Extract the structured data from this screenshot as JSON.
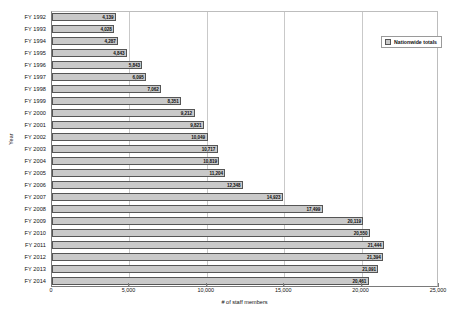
{
  "chart_data": {
    "type": "bar",
    "orientation": "horizontal",
    "title": "",
    "xlabel": "# of staff members",
    "ylabel": "Year",
    "xlim": [
      0,
      25000
    ],
    "xticks": [
      "0",
      "5,000",
      "10,000",
      "15,000",
      "20,000",
      "25,000"
    ],
    "xtick_values": [
      0,
      5000,
      10000,
      15000,
      20000,
      25000
    ],
    "grid": true,
    "legend": {
      "position": "top-right",
      "entries": [
        {
          "label": "Nationwide totals",
          "color": "#c9c9c9"
        }
      ]
    },
    "categories": [
      "FY 1992",
      "FY 1993",
      "FY 1994",
      "FY 1995",
      "FY 1996",
      "FY 1997",
      "FY 1998",
      "FY 1999",
      "FY 2000",
      "FY 2001",
      "FY 2002",
      "FY 2003",
      "FY 2004",
      "FY 2005",
      "FY 2006",
      "FY 2007",
      "FY 2008",
      "FY 2009",
      "FY 2010",
      "FY 2011",
      "FY 2012",
      "FY 2013",
      "FY 2014"
    ],
    "values": [
      4139,
      4028,
      4287,
      4843,
      5843,
      6095,
      7062,
      8351,
      9212,
      9821,
      10049,
      10717,
      10819,
      11204,
      12348,
      14923,
      17499,
      20119,
      20550,
      21444,
      21394,
      21091,
      20461
    ],
    "value_labels": [
      "4,139",
      "4,028",
      "4,287",
      "4,843",
      "5,843",
      "6,095",
      "7,062",
      "8,351",
      "9,212",
      "9,821",
      "10,049",
      "10,717",
      "10,819",
      "11,204",
      "12,348",
      "14,923",
      "17,499",
      "20,119",
      "20,550",
      "21,444",
      "21,394",
      "21,091",
      "20,461"
    ],
    "series": [
      {
        "name": "Nationwide totals",
        "values": [
          4139,
          4028,
          4287,
          4843,
          5843,
          6095,
          7062,
          8351,
          9212,
          9821,
          10049,
          10717,
          10819,
          11204,
          12348,
          14923,
          17499,
          20119,
          20550,
          21444,
          21394,
          21091,
          20461
        ]
      }
    ],
    "colors": {
      "bar_fill": "#c9c9c9",
      "bar_edge": "#555555",
      "gridline": "#c9c9c9",
      "axis": "#7a7a7a"
    }
  }
}
